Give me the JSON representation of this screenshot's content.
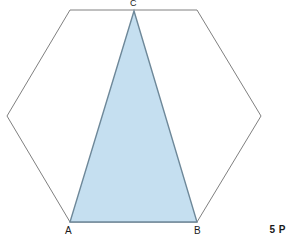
{
  "figure": {
    "background_color": "#ffffff",
    "width": 292,
    "height": 241,
    "hexagon": {
      "name": "regular-hexagon",
      "stroke_color": "#808080",
      "stroke_width": 1,
      "fill_color": "none",
      "points": "70,10 197,10 261,116 197,222 70,222 7,116",
      "vertices": [
        {
          "label": "",
          "x": 70,
          "y": 10
        },
        {
          "label": "",
          "x": 197,
          "y": 10
        },
        {
          "label": "",
          "x": 261,
          "y": 116
        },
        {
          "label": "B",
          "x": 197,
          "y": 222
        },
        {
          "label": "A",
          "x": 70,
          "y": 222
        },
        {
          "label": "",
          "x": 7,
          "y": 116
        }
      ]
    },
    "triangle": {
      "name": "shaded-triangle-abc",
      "stroke_color": "#6e8899",
      "stroke_width": 1.4,
      "fill_color": "#c5dff0",
      "points": "70,222 197,222 134,11",
      "vertices": [
        {
          "label": "A",
          "x": 70,
          "y": 222
        },
        {
          "label": "B",
          "x": 197,
          "y": 222
        },
        {
          "label": "C",
          "x": 134,
          "y": 11
        }
      ]
    }
  },
  "labels": {
    "vertex_a": "A",
    "vertex_b": "B",
    "vertex_c": "C"
  },
  "badge": {
    "points_text": "5 P"
  }
}
